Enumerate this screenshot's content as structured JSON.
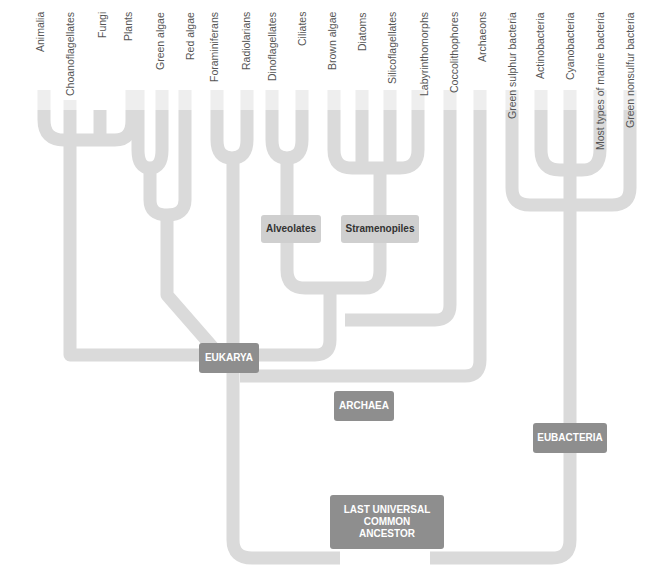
{
  "colors": {
    "branch": "#dcdcdc",
    "branch_light": "#ececec",
    "node_dark": "#8e8e8e",
    "node_light": "#cfcfcf"
  },
  "leaves": [
    {
      "label": "Animalia",
      "x": 70
    },
    {
      "label": "Choanoflagellates",
      "x": 100
    },
    {
      "label": "Fungi",
      "x": 132
    },
    {
      "label": "Plants",
      "x": 138
    },
    {
      "label": "Green algae",
      "x": 162
    },
    {
      "label": "Red algae",
      "x": 190
    },
    {
      "label": "Foraminiferans",
      "x": 217
    },
    {
      "label": "Radiolarians",
      "x": 247
    },
    {
      "label": "Dinoflagellates",
      "x": 272
    },
    {
      "label": "Ciliates",
      "x": 302
    },
    {
      "label": "Brown algae",
      "x": 334
    },
    {
      "label": "Diatoms",
      "x": 362
    },
    {
      "label": "Silicoflagellates",
      "x": 390
    },
    {
      "label": "Labyrinthomorphs",
      "x": 420
    },
    {
      "label": "Coccolithophores",
      "x": 450
    },
    {
      "label": "Archaeons",
      "x": 480
    },
    {
      "label": "Green sulphur bacteria",
      "x": 512
    },
    {
      "label": "Actinobacteria",
      "x": 541
    },
    {
      "label": "Cyanobacteria",
      "x": 570
    },
    {
      "label": "Most types of marine bacteria",
      "x": 600
    },
    {
      "label": "Green nonsulfur bacteria",
      "x": 630
    }
  ],
  "nodes": {
    "alveolates": "Alveolates",
    "stramenopiles": "Stramenopiles",
    "eukarya": "EUKARYA",
    "archaea": "ARCHAEA",
    "eubacteria": "EUBACTERIA",
    "luca_line1": "LAST UNIVERSAL",
    "luca_line2": "COMMON",
    "luca_line3": "ANCESTOR"
  }
}
